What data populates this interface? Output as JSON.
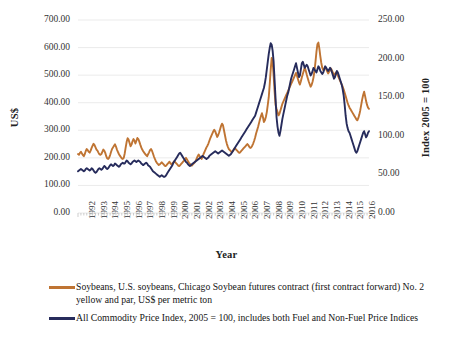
{
  "chart_data": {
    "type": "line",
    "title": "",
    "xlabel": "Year",
    "ylabel": "US$",
    "ylabel_secondary": "Index 2005 = 100",
    "grid": true,
    "legend_position": "bottom",
    "x": [
      1992,
      1993,
      1994,
      1995,
      1996,
      1997,
      1998,
      1999,
      2000,
      2001,
      2002,
      2003,
      2004,
      2005,
      2006,
      2007,
      2008,
      2009,
      2010,
      2011,
      2012,
      2013,
      2014,
      2015,
      2016
    ],
    "xtick_labels": [
      "1992",
      "1993",
      "1994",
      "1995",
      "1996",
      "1997",
      "1998",
      "1999",
      "2000",
      "2001",
      "2002",
      "2003",
      "2004",
      "2005",
      "2006",
      "2007",
      "2008",
      "2009",
      "2010",
      "2011",
      "2012",
      "2013",
      "2014",
      "2015",
      "2016"
    ],
    "ylim": [
      0,
      700
    ],
    "ytick_labels": [
      "0.00",
      "100.00",
      "200.00",
      "300.00",
      "400.00",
      "500.00",
      "600.00",
      "700.00"
    ],
    "ytick_values": [
      0,
      100,
      200,
      300,
      400,
      500,
      600,
      700
    ],
    "ylim_secondary": [
      0,
      250
    ],
    "ytick_labels_secondary": [
      "0.00",
      "50.00",
      "100.00",
      "150.00",
      "200.00",
      "250.00"
    ],
    "ytick_values_secondary": [
      0,
      50,
      100,
      150,
      200,
      250
    ],
    "series": [
      {
        "name": "Soybeans, U.S. soybeans, Chicago Soybean futures contract (first contract forward) No. 2 yellow and par, US$ per metric ton",
        "short_name": "Soybeans",
        "color": "#bf7433",
        "axis": "left",
        "units": "US$ per metric ton",
        "monthly_values": [
          214,
          211,
          218,
          222,
          216,
          210,
          206,
          214,
          225,
          232,
          228,
          222,
          219,
          226,
          236,
          244,
          251,
          246,
          238,
          230,
          226,
          219,
          213,
          211,
          214,
          222,
          230,
          226,
          218,
          206,
          198,
          196,
          201,
          210,
          222,
          232,
          238,
          244,
          249,
          241,
          230,
          222,
          214,
          208,
          203,
          198,
          196,
          200,
          216,
          238,
          258,
          271,
          266,
          254,
          242,
          248,
          260,
          268,
          262,
          252,
          262,
          272,
          268,
          259,
          248,
          238,
          230,
          224,
          219,
          214,
          210,
          206,
          213,
          220,
          228,
          232,
          226,
          216,
          205,
          196,
          188,
          182,
          178,
          174,
          176,
          180,
          184,
          180,
          176,
          172,
          170,
          174,
          178,
          182,
          186,
          180,
          176,
          180,
          184,
          188,
          184,
          180,
          176,
          172,
          170,
          174,
          178,
          182,
          186,
          190,
          196,
          200,
          194,
          188,
          182,
          178,
          174,
          172,
          176,
          180,
          184,
          190,
          198,
          206,
          212,
          206,
          200,
          196,
          204,
          214,
          222,
          230,
          238,
          244,
          252,
          262,
          272,
          280,
          288,
          296,
          302,
          296,
          286,
          276,
          282,
          292,
          304,
          316,
          324,
          318,
          300,
          282,
          264,
          250,
          240,
          232,
          228,
          224,
          220,
          224,
          230,
          236,
          232,
          228,
          224,
          220,
          218,
          222,
          226,
          230,
          234,
          238,
          242,
          246,
          250,
          246,
          240,
          236,
          238,
          244,
          252,
          262,
          274,
          288,
          300,
          312,
          326,
          340,
          352,
          362,
          348,
          330,
          336,
          348,
          366,
          392,
          420,
          468,
          520,
          562,
          548,
          498,
          440,
          392,
          378,
          366,
          354,
          360,
          372,
          384,
          396,
          404,
          412,
          420,
          428,
          436,
          444,
          452,
          460,
          468,
          476,
          484,
          492,
          500,
          508,
          498,
          486,
          474,
          466,
          478,
          492,
          504,
          516,
          528,
          516,
          502,
          490,
          478,
          468,
          458,
          464,
          476,
          492,
          516,
          548,
          584,
          612,
          618,
          596,
          568,
          544,
          526,
          518,
          524,
          530,
          522,
          514,
          506,
          512,
          518,
          524,
          516,
          508,
          500,
          504,
          510,
          506,
          498,
          490,
          482,
          474,
          466,
          458,
          448,
          436,
          424,
          412,
          400,
          390,
          382,
          376,
          370,
          364,
          358,
          352,
          346,
          340,
          336,
          344,
          356,
          372,
          392,
          412,
          428,
          440,
          424,
          406,
          392,
          382,
          378
        ],
        "annual_approx": [
          215,
          235,
          215,
          235,
          262,
          245,
          205,
          178,
          178,
          176,
          195,
          270,
          295,
          225,
          238,
          300,
          450,
          395,
          475,
          490,
          560,
          515,
          475,
          370,
          395
        ],
        "peaks": [
          {
            "year": 2008,
            "value": 562,
            "note": "2008 food-price spike"
          },
          {
            "year": 2012,
            "value": 618,
            "note": "2012 record high"
          }
        ],
        "trough": {
          "year": 2001,
          "value": 170
        }
      },
      {
        "name": "All Commodity Price Index, 2005 = 100, includes both Fuel and Non-Fuel Price Indices",
        "short_name": "All Commodity Price Index",
        "color": "#272c5c",
        "axis": "right",
        "units": "Index 2005 = 100",
        "monthly_values": [
          54,
          55,
          56,
          57,
          56,
          55,
          54,
          55,
          57,
          58,
          57,
          56,
          55,
          56,
          58,
          57,
          55,
          53,
          52,
          53,
          55,
          57,
          58,
          57,
          56,
          57,
          59,
          61,
          60,
          58,
          57,
          58,
          60,
          62,
          63,
          62,
          61,
          62,
          64,
          63,
          62,
          61,
          60,
          61,
          63,
          64,
          65,
          64,
          64,
          66,
          68,
          67,
          65,
          64,
          63,
          64,
          66,
          67,
          68,
          67,
          66,
          67,
          68,
          67,
          66,
          64,
          63,
          62,
          63,
          64,
          65,
          64,
          62,
          61,
          60,
          58,
          56,
          54,
          53,
          52,
          51,
          50,
          49,
          48,
          47,
          48,
          49,
          48,
          47,
          47,
          48,
          50,
          52,
          54,
          56,
          58,
          60,
          62,
          65,
          67,
          69,
          71,
          73,
          75,
          77,
          78,
          76,
          74,
          72,
          70,
          68,
          66,
          65,
          63,
          62,
          61,
          62,
          63,
          64,
          65,
          66,
          67,
          68,
          69,
          70,
          71,
          72,
          73,
          74,
          73,
          72,
          71,
          70,
          71,
          72,
          74,
          75,
          76,
          77,
          78,
          79,
          80,
          79,
          78,
          77,
          78,
          79,
          80,
          81,
          80,
          79,
          78,
          77,
          76,
          75,
          74,
          75,
          76,
          78,
          80,
          82,
          84,
          86,
          88,
          90,
          92,
          94,
          96,
          98,
          100,
          102,
          104,
          106,
          108,
          110,
          112,
          114,
          116,
          118,
          120,
          122,
          124,
          126,
          130,
          134,
          138,
          142,
          146,
          150,
          154,
          158,
          162,
          168,
          176,
          186,
          196,
          206,
          214,
          220,
          218,
          210,
          196,
          172,
          148,
          124,
          112,
          104,
          100,
          106,
          114,
          122,
          128,
          134,
          140,
          146,
          152,
          156,
          162,
          168,
          174,
          178,
          182,
          186,
          190,
          194,
          188,
          182,
          176,
          178,
          186,
          194,
          196,
          192,
          188,
          190,
          192,
          190,
          186,
          182,
          178,
          180,
          184,
          188,
          186,
          184,
          182,
          186,
          190,
          188,
          184,
          182,
          180,
          182,
          186,
          190,
          188,
          186,
          184,
          186,
          188,
          186,
          182,
          178,
          174,
          176,
          180,
          184,
          182,
          178,
          174,
          170,
          166,
          160,
          152,
          140,
          126,
          116,
          110,
          106,
          104,
          100,
          96,
          92,
          88,
          84,
          80,
          78,
          80,
          84,
          88,
          92,
          96,
          100,
          104,
          106,
          102,
          98,
          100,
          104,
          106
        ],
        "annual_approx": [
          56,
          56,
          61,
          66,
          66,
          58,
          50,
          61,
          73,
          64,
          70,
          76,
          78,
          84,
          109,
          140,
          190,
          120,
          172,
          188,
          184,
          185,
          170,
          95,
          100
        ],
        "peaks": [
          {
            "year": 2008,
            "value": 220,
            "note": "mid-2008 commodity peak"
          },
          {
            "year": 2011,
            "value": 196,
            "note": "post-crisis rebound"
          }
        ],
        "trough": {
          "year": 2016,
          "value": 78
        }
      }
    ]
  },
  "axes": {
    "left": {
      "title": "US$",
      "ticks": [
        "700.00",
        "600.00",
        "500.00",
        "400.00",
        "300.00",
        "200.00",
        "100.00",
        "0.00"
      ]
    },
    "right": {
      "title": "Index 2005 = 100",
      "ticks": [
        "250.00",
        "200.00",
        "150.00",
        "100.00",
        "50.00",
        "0.00"
      ]
    },
    "bottom": {
      "title": "Year",
      "ticks": [
        "1992",
        "1993",
        "1994",
        "1995",
        "1996",
        "1997",
        "1998",
        "1999",
        "2000",
        "2001",
        "2002",
        "2003",
        "2004",
        "2005",
        "2006",
        "2007",
        "2008",
        "2009",
        "2010",
        "2011",
        "2012",
        "2013",
        "2014",
        "2015",
        "2016"
      ]
    }
  },
  "legend": {
    "items": [
      {
        "label": "Soybeans, U.S. soybeans, Chicago Soybean futures contract (first contract forward) No. 2 yellow and par, US$ per metric ton",
        "color": "#bf7433"
      },
      {
        "label": "All Commodity Price Index, 2005 = 100, includes both Fuel and Non-Fuel Price Indices",
        "color": "#272c5c"
      }
    ]
  },
  "style": {
    "background": "#ffffff",
    "grid_color": "#e9e9e9",
    "text_color": "#1a1a1a",
    "series_orange": "#bf7433",
    "series_navy": "#272c5c"
  }
}
